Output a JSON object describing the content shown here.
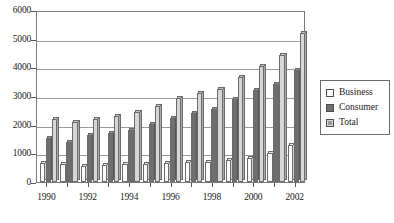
{
  "chart_data": {
    "type": "bar",
    "title": "",
    "subtitle": "",
    "xlabel": "",
    "ylabel": "",
    "ylim": [
      0,
      6000
    ],
    "ytick_values": [
      6000,
      5000,
      4000,
      3000,
      2000,
      1000,
      0
    ],
    "ytick_labels": [
      "6000",
      "5000",
      "4000",
      "3000",
      "2000",
      "1000",
      "0"
    ],
    "grid": true,
    "legend_position": "right",
    "categories": [
      "1990",
      "1991",
      "1992",
      "1993",
      "1994",
      "1995",
      "1996",
      "1997",
      "1998",
      "1999",
      "2000",
      "2001",
      "2002"
    ],
    "xtick_labels_shown": [
      "1990",
      "1992",
      "1994",
      "1996",
      "1998",
      "2000",
      "2002"
    ],
    "series": [
      {
        "name": "Business",
        "color": "#fdfdfd",
        "values": [
          680,
          640,
          560,
          600,
          620,
          640,
          680,
          700,
          700,
          760,
          840,
          1000,
          1300
        ]
      },
      {
        "name": "Consumer",
        "color": "#6e6e6e",
        "values": [
          1520,
          1380,
          1640,
          1700,
          1820,
          2020,
          2240,
          2420,
          2560,
          2900,
          3200,
          3420,
          3900
        ]
      },
      {
        "name": "Total",
        "color": "#d6d6d6",
        "values": [
          2200,
          2100,
          2200,
          2300,
          2440,
          2660,
          2920,
          3120,
          3260,
          3660,
          4040,
          4420,
          5200
        ]
      }
    ]
  },
  "legend": {
    "items": [
      {
        "label": "Business",
        "key": "business-swatch"
      },
      {
        "label": "Consumer",
        "key": "consumer-swatch"
      },
      {
        "label": "Total",
        "key": "total-swatch"
      }
    ]
  }
}
